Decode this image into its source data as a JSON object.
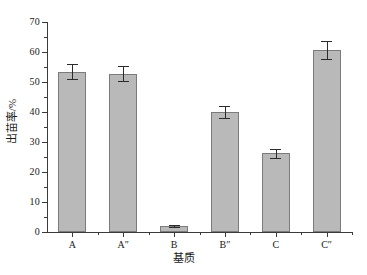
{
  "chart_data": {
    "type": "bar",
    "title": "",
    "subtitle": "",
    "xlabel": "基质",
    "ylabel": "出苗率/%",
    "categories": [
      "A",
      "A″",
      "B",
      "B″",
      "C",
      "C″"
    ],
    "values": [
      53.5,
      52.7,
      2.0,
      40.0,
      26.3,
      60.7
    ],
    "errors": [
      2.5,
      2.5,
      0.4,
      2.0,
      1.5,
      3.0
    ],
    "series": [
      {
        "name": "出苗率",
        "values": [
          53.5,
          52.7,
          2.0,
          40.0,
          26.3,
          60.7
        ],
        "errors": [
          2.5,
          2.5,
          0.4,
          2.0,
          1.5,
          3.0
        ]
      }
    ],
    "ylim": [
      0,
      70
    ],
    "ytick_step": 10,
    "yticks": [
      0,
      10,
      20,
      30,
      40,
      50,
      60,
      70
    ],
    "ytick_labels": [
      "0",
      "10",
      "20",
      "30",
      "40",
      "50",
      "60",
      "70"
    ],
    "yminor_ticks": [
      5,
      15,
      25,
      35,
      45,
      55,
      65
    ],
    "grid": false,
    "legend": null,
    "legend_position": "none",
    "bar_fill_color": "#b9b9b9",
    "bar_edge_color": "#7b7b7b",
    "error_bar_color": "#2b2b2b",
    "axis_color": "#3a3a3a",
    "background_color": "#ffffff",
    "annotations": []
  },
  "axes": {
    "y_title": "出苗率/%",
    "x_title": "基质"
  }
}
